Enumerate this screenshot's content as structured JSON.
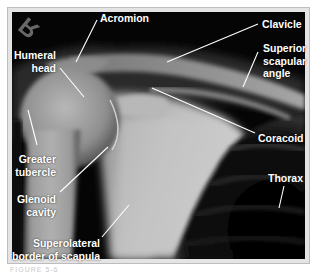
{
  "figure": {
    "type": "radiograph",
    "view": "shoulder X-ray",
    "side_marker": "R",
    "caption_partial": "FIGURE 5-6"
  },
  "labels": {
    "acromion": "Acromion",
    "clavicle": "Clavicle",
    "humeral_head_1": "Humeral",
    "humeral_head_2": "head",
    "superior_scapular_angle_1": "Superior",
    "superior_scapular_angle_2": "scapular",
    "superior_scapular_angle_3": "angle",
    "coracoid": "Coracoid",
    "greater_tubercle_1": "Greater",
    "greater_tubercle_2": "tubercle",
    "glenoid_cavity_1": "Glenoid",
    "glenoid_cavity_2": "cavity",
    "thorax": "Thorax",
    "superolateral_1": "Superolateral",
    "superolateral_2": "border of scapula"
  },
  "colors": {
    "frame": "#e4e4e4",
    "background": "#000000",
    "label": "#ffffff",
    "marker": "#7a7a7a"
  }
}
